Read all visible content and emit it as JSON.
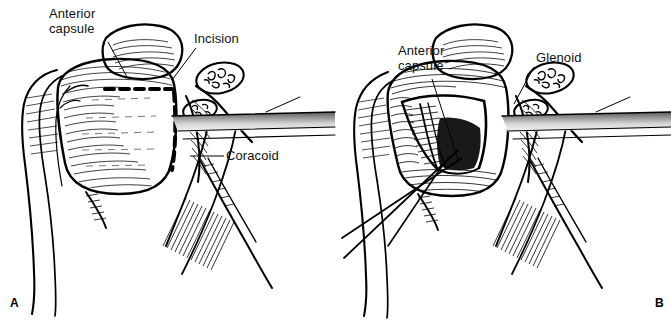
{
  "figure": {
    "background_color": "#ffffff",
    "ink_color": "#000000",
    "width": 671,
    "height": 328,
    "panel_count": 2
  },
  "panels": [
    {
      "letter": "A",
      "letter_x": 10,
      "letter_y": 299,
      "caption_note": "Capsule intact with dashed T-shaped incision outline marked",
      "labels": [
        {
          "name": "anterior-capsule",
          "lines": [
            "Anterior",
            "capsule"
          ],
          "text": "Anterior\ncapsule",
          "x": 49,
          "y": 7,
          "leader": {
            "x1": 108,
            "y1": 42,
            "x2": 127,
            "y2": 77
          }
        },
        {
          "name": "incision",
          "lines": [
            "Incision"
          ],
          "text": "Incision",
          "x": 194,
          "y": 32,
          "leader": {
            "x1": 196,
            "y1": 48,
            "x2": 172,
            "y2": 80
          }
        },
        {
          "name": "coracoid",
          "lines": [
            "Coracoid"
          ],
          "text": "Coracoid",
          "x": 226,
          "y": 149,
          "leader": {
            "x1": 224,
            "y1": 156,
            "x2": 190,
            "y2": 156
          }
        }
      ],
      "features": {
        "retractor": {
          "present": true,
          "style": "metal blade, gray gradient",
          "color_dark": "#6f6f6f",
          "color_light": "#f0f0f0"
        },
        "incision_line": {
          "style": "dashed",
          "shape": "T / L shaped over capsule"
        },
        "bone_cross_sections": 2
      }
    },
    {
      "letter": "B",
      "letter_x": 655,
      "letter_y": 299,
      "caption_note": "Capsule incised and flap retracted with traction sutures exposing glenoid",
      "labels": [
        {
          "name": "anterior-capsule",
          "lines": [
            "Anterior",
            "capsule"
          ],
          "text": "Anterior\ncapsule",
          "x": 62,
          "y": 44,
          "leader": {
            "x1": 96,
            "y1": 79,
            "x2": 122,
            "y2": 160
          }
        },
        {
          "name": "glenoid",
          "lines": [
            "Glenoid"
          ],
          "text": "Glenoid",
          "x": 200,
          "y": 51,
          "leader": {
            "x1": 198,
            "y1": 67,
            "x2": 178,
            "y2": 104
          }
        }
      ],
      "features": {
        "retractor": {
          "present": true,
          "style": "metal blade, gray gradient",
          "color_dark": "#6f6f6f",
          "color_light": "#f0f0f0"
        },
        "sutures": {
          "count": 3,
          "direction": "down-left traction"
        },
        "capsule_flap": {
          "open": true
        }
      }
    }
  ]
}
